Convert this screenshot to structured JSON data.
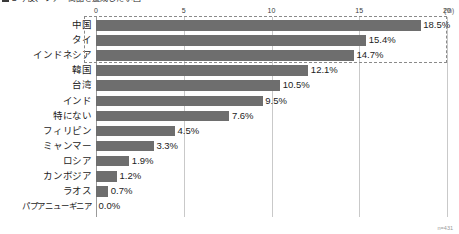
{
  "chart_data": {
    "type": "bar",
    "orientation": "horizontal",
    "title": "■ 今後、ツアー商品を造成したい国",
    "xlabel": "",
    "ylabel": "",
    "xunit": "(%)",
    "xlim": [
      0,
      20
    ],
    "xticks": [
      0,
      5,
      10,
      15,
      20
    ],
    "xtick_labels": [
      "0",
      "5",
      "10",
      "15",
      "20"
    ],
    "grid": true,
    "legend": "none",
    "sample_note": "n=431",
    "categories": [
      "中国",
      "タイ",
      "インドネシア",
      "韓国",
      "台湾",
      "インド",
      "特にない",
      "フィリピン",
      "ミャンマー",
      "ロシア",
      "カンボジア",
      "ラオス",
      "パプアニューギニア"
    ],
    "values": [
      18.5,
      15.4,
      14.7,
      12.1,
      10.5,
      9.5,
      7.6,
      4.5,
      3.3,
      1.9,
      1.2,
      0.7,
      0.0
    ],
    "value_labels": [
      "18.5%",
      "15.4%",
      "14.7%",
      "12.1%",
      "10.5%",
      "9.5%",
      "7.6%",
      "4.5%",
      "3.3%",
      "1.9%",
      "1.2%",
      "0.7%",
      "0.0%"
    ],
    "highlight": {
      "from_index": 0,
      "to_index": 2,
      "style": "dashed-box"
    },
    "colors": {
      "bar": "#6e6e6e",
      "grid": "#c9c9c9",
      "axis": "#9a9a9a",
      "text": "#1c1c1c",
      "highlight_border": "#8a8a8a",
      "background": "#ffffff"
    }
  }
}
